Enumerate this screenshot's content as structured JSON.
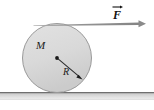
{
  "figure": {
    "type": "physics-free-body-diagram",
    "canvas": {
      "width": 154,
      "height": 110
    },
    "background_color": "#ffffff"
  },
  "labels": {
    "mass": "M",
    "radius": "R",
    "force": "F"
  },
  "disk": {
    "name": "rolling-disk",
    "center_x": 57,
    "center_y": 58,
    "radius": 34.5,
    "fill_color": "#d9d9d9",
    "edge_color": "#9a9a9a",
    "center_dot_color": "#1a1a1a"
  },
  "radius_arrow": {
    "name": "radius-arrow",
    "from_x": 57,
    "from_y": 58,
    "to_x": 82,
    "to_y": 79,
    "color": "#2b2b2b"
  },
  "force_arrow": {
    "name": "force-arrow",
    "from_x": 33,
    "from_y": 24,
    "to_x": 146,
    "to_y": 24,
    "color": "#8c8c8c",
    "notation": "vector"
  },
  "ground": {
    "name": "ground-surface",
    "top_y": 92,
    "height": 7,
    "top_edge_color": "#6f6f6f",
    "fill_top_color": "#c9c9c9",
    "fill_bottom_color": "#eaeaea"
  }
}
